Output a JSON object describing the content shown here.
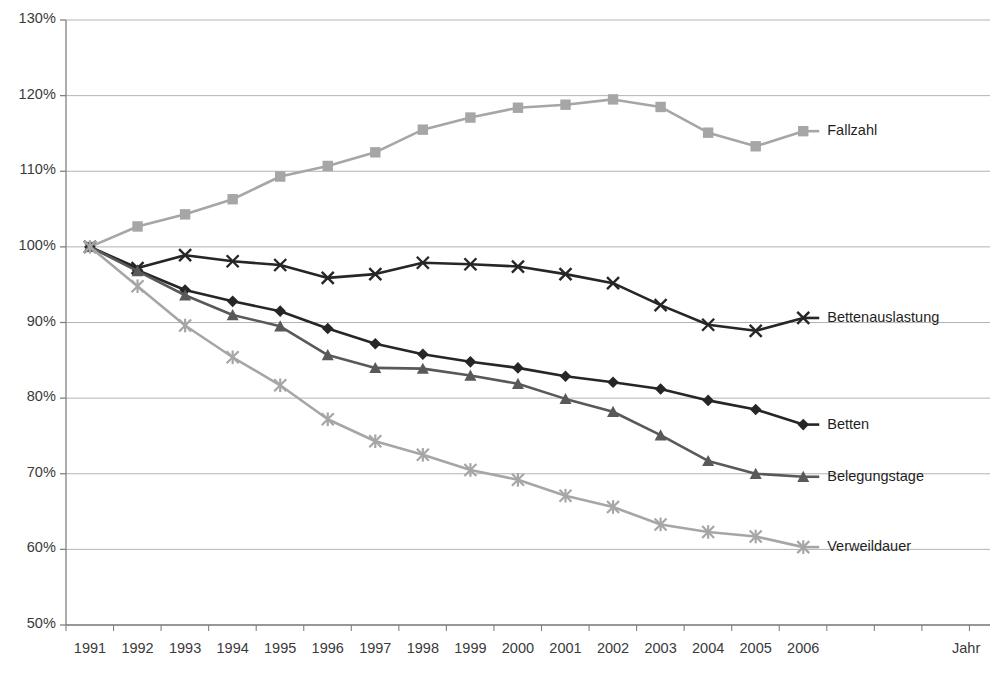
{
  "chart_data": {
    "type": "line",
    "title": "",
    "subtitle": "",
    "xlabel": "Jahr",
    "ylabel": "",
    "categories": [
      "1991",
      "1992",
      "1993",
      "1994",
      "1995",
      "1996",
      "1997",
      "1998",
      "1999",
      "2000",
      "2001",
      "2002",
      "2003",
      "2004",
      "2005",
      "2006"
    ],
    "x": [
      1991,
      1992,
      1993,
      1994,
      1995,
      1996,
      1997,
      1998,
      1999,
      2000,
      2001,
      2002,
      2003,
      2004,
      2005,
      2006
    ],
    "ylim": [
      50,
      130
    ],
    "yticks": [
      50,
      60,
      70,
      80,
      90,
      100,
      110,
      120,
      130
    ],
    "ytick_labels": [
      "50%",
      "60%",
      "70%",
      "80%",
      "90%",
      "100%",
      "110%",
      "120%",
      "130%"
    ],
    "grid": true,
    "grid_axis": "y",
    "legend_position": "right-inline-end-of-line",
    "units": "percent (index, 1991 = 100%)",
    "series": [
      {
        "name": "Fallzahl",
        "marker": "square",
        "color": "#a6a6a6",
        "label_color": "#1f1f1f",
        "values": [
          100.0,
          102.7,
          104.3,
          106.3,
          109.3,
          110.7,
          112.5,
          115.5,
          117.1,
          118.4,
          118.8,
          119.5,
          118.5,
          115.1,
          113.3,
          115.3
        ]
      },
      {
        "name": "Bettenauslastung",
        "marker": "cross",
        "color": "#262626",
        "label_color": "#1f1f1f",
        "values": [
          100.0,
          97.2,
          98.9,
          98.1,
          97.6,
          95.9,
          96.4,
          97.9,
          97.7,
          97.4,
          96.4,
          95.2,
          92.3,
          89.7,
          88.9,
          90.6
        ]
      },
      {
        "name": "Betten",
        "marker": "diamond",
        "color": "#262626",
        "label_color": "#1f1f1f",
        "values": [
          100.0,
          96.9,
          94.3,
          92.8,
          91.5,
          89.2,
          87.2,
          85.8,
          84.8,
          84.0,
          82.9,
          82.1,
          81.2,
          79.7,
          78.5,
          76.5
        ]
      },
      {
        "name": "Belegungstage",
        "marker": "triangle",
        "color": "#595959",
        "label_color": "#1f1f1f",
        "values": [
          100.0,
          96.8,
          93.6,
          91.0,
          89.5,
          85.7,
          84.0,
          83.9,
          83.0,
          81.9,
          79.9,
          78.2,
          75.1,
          71.7,
          70.0,
          69.6
        ]
      },
      {
        "name": "Verweildauer",
        "marker": "star",
        "color": "#a6a6a6",
        "label_color": "#1f1f1f",
        "values": [
          100.0,
          94.8,
          89.6,
          85.4,
          81.7,
          77.2,
          74.3,
          72.5,
          70.5,
          69.2,
          67.1,
          65.6,
          63.3,
          62.3,
          61.7,
          60.3
        ]
      }
    ]
  },
  "axes": {
    "x_axis_title": "Jahr",
    "y_axis_title": ""
  },
  "colors": {
    "gridline": "#b3b3b3",
    "axis": "#808080",
    "background": "#ffffff",
    "text": "#3a3a3a",
    "light_gray_series": "#a6a6a6",
    "mid_gray_series": "#595959",
    "dark_series": "#262626"
  }
}
